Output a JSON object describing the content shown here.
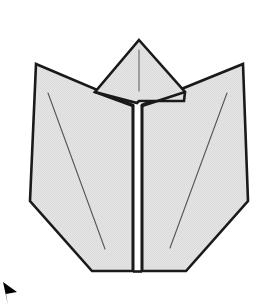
{
  "figure": {
    "caption": "",
    "canvas": {
      "width": 272,
      "height": 307,
      "background": "#ffffff"
    },
    "style": {
      "paper_fill": "#e2e2e2",
      "paper_fill_light": "#e8e8e8",
      "outline_color": "#1a1a1a",
      "outline_width": 2.6,
      "crease_color": "#555555",
      "crease_width": 1.0,
      "marker_color": "#000000"
    },
    "parts": [
      {
        "id": "center-top-flap",
        "label": "Center top flap",
        "kind": "paper-face",
        "fill": "#e2e2e2",
        "points": "139,40 185,92 184,101 139,101 137,103 95,92"
      },
      {
        "id": "left-wing-panel",
        "label": "Left wing panel",
        "kind": "paper-face",
        "fill": "#e2e2e2",
        "points": "36,64 133,105 133,271 92,271 30,201"
      },
      {
        "id": "right-wing-panel",
        "label": "Right wing panel",
        "kind": "paper-face",
        "fill": "#e2e2e2",
        "points": "243,64 248,201 186,271 142,271 142,105"
      }
    ],
    "creases": [
      {
        "id": "top-flap-center-crease",
        "label": "Top flap center crease",
        "x1": 139,
        "y1": 50,
        "x2": 139,
        "y2": 91
      },
      {
        "id": "left-wing-crease",
        "label": "Left wing diagonal crease",
        "x1": 48,
        "y1": 93,
        "x2": 105,
        "y2": 249
      },
      {
        "id": "right-wing-crease",
        "label": "Right wing diagonal crease",
        "x1": 227,
        "y1": 93,
        "x2": 170,
        "y2": 248
      }
    ],
    "center_seam": {
      "id": "center-vertical-seam",
      "label": "Center vertical seam",
      "left_x": 133,
      "right_x": 142,
      "top_y": 105,
      "bottom_y": 272
    },
    "marker": {
      "id": "corner-arrow-marker",
      "label": "Corner arrow marker",
      "points": "3,282 17,292 6,294 8,305",
      "fill": "#000000"
    }
  }
}
